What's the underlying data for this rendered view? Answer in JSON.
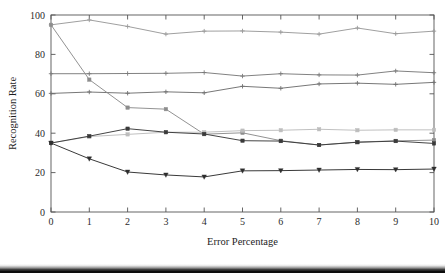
{
  "chart_data": {
    "type": "line",
    "title": "",
    "subtitle": "",
    "xlabel": "Error Percentage",
    "ylabel": "Recognition Rate",
    "x": [
      0,
      1,
      2,
      3,
      4,
      5,
      6,
      7,
      8,
      9,
      10
    ],
    "xlim": [
      0,
      10
    ],
    "ylim": [
      0,
      100
    ],
    "xticks": [
      "0",
      "1",
      "2",
      "3",
      "4",
      "5",
      "6",
      "7",
      "8",
      "9",
      "10"
    ],
    "yticks": [
      "0",
      "20",
      "40",
      "60",
      "80",
      "100"
    ],
    "grid": false,
    "legend": "none",
    "series": [
      {
        "name": "series-1",
        "color": "#9a9a9a",
        "marker": "plus",
        "values": [
          95.0,
          97.5,
          94.2,
          90.3,
          91.8,
          91.9,
          91.3,
          90.3,
          93.4,
          90.5,
          91.8
        ]
      },
      {
        "name": "series-2",
        "color": "#7a7a7a",
        "marker": "plus",
        "values": [
          70.2,
          70.2,
          70.3,
          70.4,
          70.8,
          69.0,
          70.2,
          69.6,
          69.5,
          71.6,
          70.7
        ]
      },
      {
        "name": "series-3",
        "color": "#707070",
        "marker": "plus",
        "values": [
          60.2,
          60.9,
          60.3,
          61.0,
          60.5,
          63.8,
          62.8,
          65.0,
          65.4,
          64.8,
          65.8
        ]
      },
      {
        "name": "series-4",
        "color": "#8c8c8c",
        "marker": "square",
        "values": [
          95.0,
          67.2,
          53.0,
          52.2,
          39.5,
          40.2,
          36.2,
          34.0,
          35.5,
          36.1,
          36.5
        ]
      },
      {
        "name": "series-5",
        "color": "#bdbdbd",
        "marker": "square",
        "values": [
          35.0,
          38.3,
          39.4,
          40.5,
          40.5,
          41.3,
          41.5,
          42.0,
          41.5,
          41.7,
          41.7
        ]
      },
      {
        "name": "series-6",
        "color": "#3a3a3a",
        "marker": "square",
        "values": [
          35.0,
          38.5,
          42.3,
          40.5,
          39.6,
          36.2,
          36.0,
          34.0,
          35.4,
          36.0,
          34.8
        ]
      },
      {
        "name": "series-7",
        "color": "#2e2e2e",
        "marker": "triangle-down",
        "values": [
          35.0,
          27.0,
          20.3,
          18.8,
          17.8,
          20.9,
          21.0,
          21.3,
          21.6,
          21.5,
          21.8
        ]
      }
    ]
  },
  "axes": {
    "y_title": "Recognition Rate",
    "x_title": "Error Percentage",
    "y_tick_labels": [
      "100",
      "80",
      "60",
      "40",
      "20",
      "0"
    ],
    "x_tick_labels": [
      "0",
      "1",
      "2",
      "3",
      "4",
      "5",
      "6",
      "7",
      "8",
      "9",
      "10"
    ]
  },
  "colors": {
    "frame": "#555555",
    "text": "#1d1d1d",
    "background": "#ffffff",
    "bottom_band": "#141414"
  }
}
